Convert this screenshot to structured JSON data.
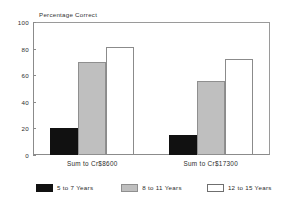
{
  "chart_data": {
    "type": "bar",
    "title": "Percentage Correct",
    "xlabel": "",
    "ylabel": "",
    "ylim": [
      0,
      100
    ],
    "yticks": [
      0,
      20,
      40,
      60,
      80,
      100
    ],
    "ytick_labels": [
      "0",
      "20",
      "40",
      "60",
      "80",
      "100"
    ],
    "grid": false,
    "legend_position": "bottom",
    "categories": [
      "Sum to Cr$8600",
      "Sum to Cr$17300"
    ],
    "series": [
      {
        "name": "5 to 7 Years",
        "color": "#111111",
        "values": [
          20,
          15
        ]
      },
      {
        "name": "8 to 11 Years",
        "color": "#bfbfbf",
        "values": [
          70,
          56
        ]
      },
      {
        "name": "12 to 15 Years",
        "color": "#ffffff",
        "values": [
          81,
          72
        ]
      }
    ]
  },
  "colors": {
    "axis": "#8b8b8b",
    "text": "#2b2b2b",
    "background": "#ffffff",
    "series_black": "#111111",
    "series_gray": "#bfbfbf",
    "series_white": "#ffffff"
  }
}
